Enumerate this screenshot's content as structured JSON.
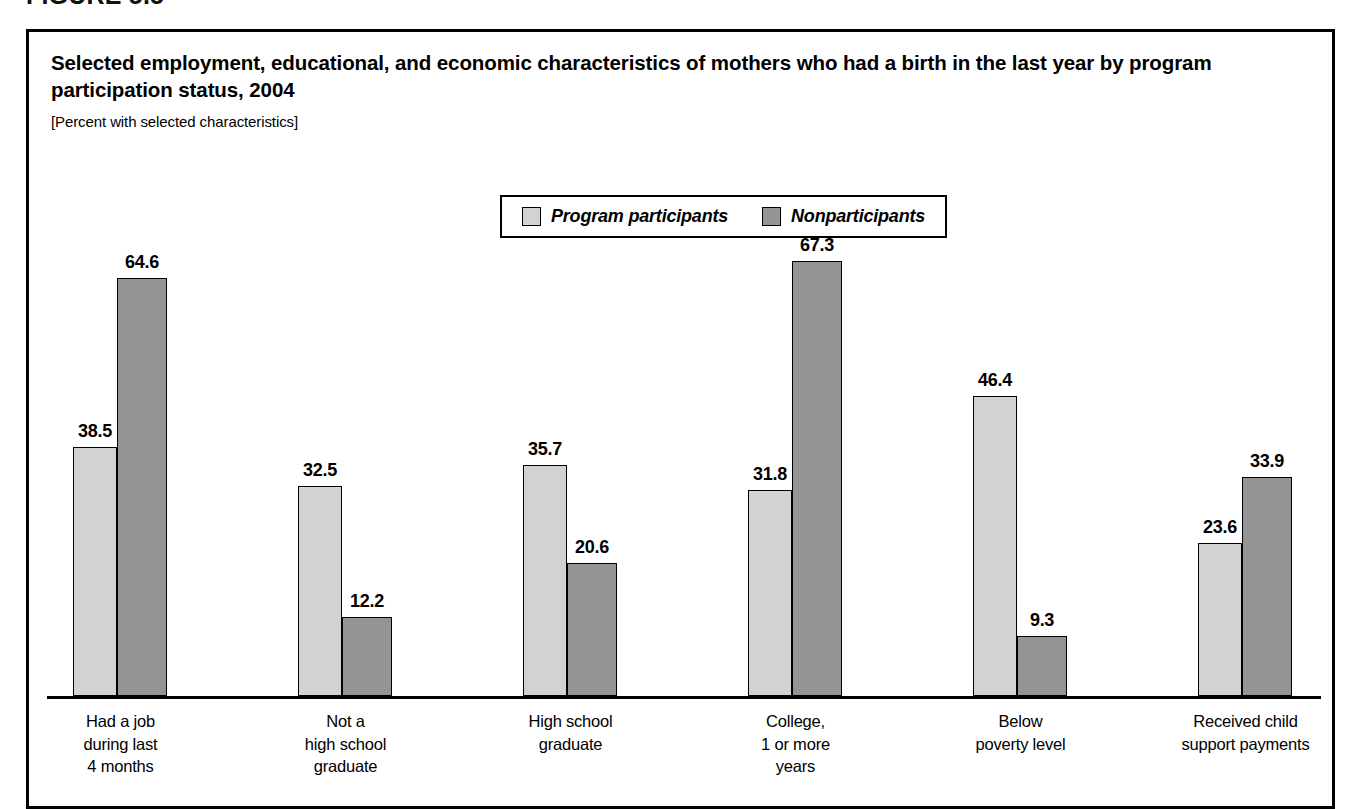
{
  "figure": {
    "number": "FIGURE 5.5",
    "title": "Selected employment, educational, and economic characteristics of mothers who had a birth in the last year by program participation status, 2004",
    "subtitle": "[Percent with selected characteristics]"
  },
  "legend": {
    "entries": [
      {
        "label": "Program participants",
        "swatch_color": "#d2d2d2"
      },
      {
        "label": "Nonparticipants",
        "swatch_color": "#949494"
      }
    ]
  },
  "chart_data": {
    "type": "bar",
    "title": "Selected employment, educational, and economic characteristics of mothers who had a birth in the last year by program participation status, 2004",
    "subtitle": "[Percent with selected characteristics]",
    "xlabel": "",
    "ylabel": "Percent with selected characteristics",
    "ylim": [
      0,
      70
    ],
    "grid": false,
    "legend_position": "top-center",
    "categories": [
      "Had a job\nduring last\n4 months",
      "Not a\nhigh school\ngraduate",
      "High school\ngraduate",
      "College,\n1 or more\nyears",
      "Below\npoverty level",
      "Received child\nsupport payments"
    ],
    "series": [
      {
        "name": "Program participants",
        "color": "#d2d2d2",
        "values": [
          38.5,
          32.5,
          35.7,
          31.8,
          46.4,
          23.6
        ],
        "labels": [
          "38.5",
          "32.5",
          "35.7",
          "31.8",
          "46.4",
          "23.6"
        ]
      },
      {
        "name": "Nonparticipants",
        "color": "#949494",
        "values": [
          64.6,
          12.2,
          20.6,
          67.3,
          9.3,
          33.9
        ],
        "labels": [
          "64.6",
          "12.2",
          "20.6",
          "67.3",
          "9.3",
          "33.9"
        ]
      }
    ]
  }
}
